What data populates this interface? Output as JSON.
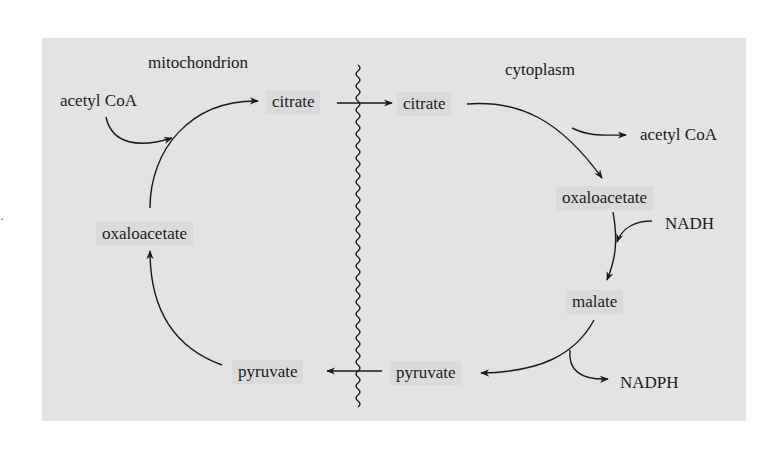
{
  "diagram": {
    "compartments": {
      "left": "mitochondrion",
      "right": "cytoplasm"
    },
    "mitochondrion": {
      "acetyl_coa": "acetyl CoA",
      "citrate": "citrate",
      "oxaloacetate": "oxaloacetate",
      "pyruvate": "pyruvate"
    },
    "cytoplasm": {
      "citrate": "citrate",
      "acetyl_coa": "acetyl CoA",
      "oxaloacetate": "oxaloacetate",
      "nadh": "NADH",
      "malate": "malate",
      "pyruvate": "pyruvate",
      "nadph": "NADPH"
    },
    "colors": {
      "panel_background": "#e3e3e3",
      "node_background": "#dadada",
      "ink": "#1a1a1a"
    },
    "edges": [
      {
        "from": "acetyl CoA (mito)",
        "to": "citrate (mito)"
      },
      {
        "from": "oxaloacetate (mito)",
        "to": "citrate (mito)"
      },
      {
        "from": "citrate (mito)",
        "to": "citrate (cyto)",
        "crosses": "membrane"
      },
      {
        "from": "citrate (cyto)",
        "to": "acetyl CoA (cyto)"
      },
      {
        "from": "citrate (cyto)",
        "to": "oxaloacetate (cyto)"
      },
      {
        "from": "NADH",
        "to": "oxaloacetate→malate"
      },
      {
        "from": "oxaloacetate (cyto)",
        "to": "malate"
      },
      {
        "from": "malate",
        "to": "pyruvate (cyto)"
      },
      {
        "from": "malate→pyruvate",
        "to": "NADPH"
      },
      {
        "from": "pyruvate (cyto)",
        "to": "pyruvate (mito)",
        "crosses": "membrane"
      },
      {
        "from": "pyruvate (mito)",
        "to": "oxaloacetate (mito)"
      }
    ]
  }
}
